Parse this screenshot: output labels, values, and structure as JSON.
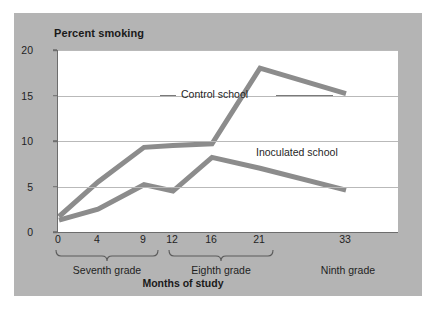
{
  "figure": {
    "panel_color": "#b4b4b4",
    "plot_background": "#ffffff",
    "line_color": "#8c8c8c",
    "axis_color": "#6d6d6d",
    "grid_color": "#b9b9b9",
    "text_color": "#1f1f1f"
  },
  "chart_data": {
    "type": "line",
    "title": "Percent smoking",
    "xlabel": "Months of study",
    "ylabel": "Percent smoking",
    "x": [
      0,
      4,
      9,
      12,
      16,
      21,
      33
    ],
    "xtick_labels": [
      "0",
      "4",
      "9",
      "12",
      "16",
      "21",
      "33"
    ],
    "ytick_labels": [
      "0",
      "5",
      "10",
      "15",
      "20"
    ],
    "yticks": [
      0,
      5,
      10,
      15,
      20
    ],
    "ylim": [
      0,
      20
    ],
    "xlim": [
      0,
      35
    ],
    "grid": "horizontal",
    "legend_position": "inline-annotation",
    "series": [
      {
        "name": "Control school",
        "values": [
          1.7,
          5.5,
          9.3,
          9.5,
          9.7,
          18.0,
          15.2
        ]
      },
      {
        "name": "Inoculated school",
        "values": [
          1.3,
          2.5,
          5.2,
          4.5,
          8.2,
          7.0,
          4.6
        ]
      }
    ],
    "annotations": [
      {
        "text": "Control school",
        "series": "Control school"
      },
      {
        "text": "Inoculated school",
        "series": "Inoculated school"
      }
    ],
    "grade_groups": [
      {
        "label": "Seventh grade",
        "from": 0,
        "to": 9
      },
      {
        "label": "Eighth grade",
        "from": 12,
        "to": 21
      },
      {
        "label": "Ninth grade",
        "from": 33,
        "to": 33
      }
    ]
  }
}
